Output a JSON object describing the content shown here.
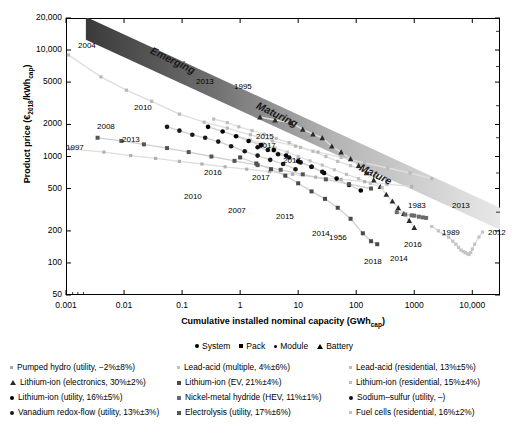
{
  "chart_data": {
    "type": "scatter",
    "title": "",
    "xlabel": "Cumulative installed nominal capacity (GWh_cap)",
    "xlabel_main": "Cumulative installed nominal capacity (GWh",
    "xlabel_sub": "cap",
    "xlabel_tail": ")",
    "ylabel": "Product price (€2018/kWh_cap)",
    "ylabel_a": "Product price (€",
    "ylabel_sub1": "2018",
    "ylabel_b": "/kWh",
    "ylabel_sub2": "cap",
    "ylabel_c": ")",
    "xscale": "log",
    "yscale": "log",
    "xlim": [
      0.001,
      30000
    ],
    "ylim": [
      50,
      20000
    ],
    "grid": false,
    "xticks": [
      "0.001",
      "0.01",
      "0.1",
      "1",
      "10",
      "100",
      "1000",
      "10,000"
    ],
    "xtick_values": [
      0.001,
      0.01,
      0.1,
      1,
      10,
      100,
      1000,
      10000
    ],
    "yticks": [
      "20,000",
      "10,000",
      "5000",
      "2000",
      "1000",
      "500",
      "200",
      "100",
      "50"
    ],
    "ytick_values": [
      20000,
      10000,
      5000,
      2000,
      1000,
      500,
      200,
      100,
      50
    ],
    "legend_position": "below-plot",
    "bands": [
      {
        "label": "Emerging",
        "shade": "dark"
      },
      {
        "label": "Maturing",
        "shade": "medium"
      },
      {
        "label": "Mature",
        "shade": "light"
      }
    ],
    "marker_legend": [
      {
        "label": "System",
        "marker": "circle"
      },
      {
        "label": "Pack",
        "marker": "square"
      },
      {
        "label": "Module",
        "marker": "dot"
      },
      {
        "label": "Battery",
        "marker": "triangle"
      }
    ],
    "series": [
      {
        "name": "Pumped hydro (utility, −2%±8%)",
        "marker": "dot",
        "color": "#b0b0b0",
        "x": [
          0.0012,
          0.0045,
          0.013,
          0.035,
          0.09,
          0.22,
          0.55,
          1.3,
          3.2,
          8.0,
          20,
          55,
          140,
          340,
          900
        ],
        "y": [
          1180,
          1100,
          1020,
          960,
          900,
          850,
          800,
          760,
          720,
          680,
          640,
          610,
          580,
          550,
          520
        ]
      },
      {
        "name": "Lead-acid (multiple, 4%±6%)",
        "marker": "dot",
        "color": "#b8b8b8",
        "x": [
          0.0011,
          0.004,
          0.011,
          0.03,
          0.09,
          0.24,
          0.6,
          1.5,
          3.6,
          9,
          22,
          55,
          140,
          350,
          850,
          2000
        ],
        "y": [
          9000,
          5600,
          4200,
          3300,
          2500,
          2100,
          1850,
          1600,
          1400,
          1250,
          1100,
          980,
          870,
          780,
          700,
          620
        ]
      },
      {
        "name": "Lead-acid (residential, 13%±5%)",
        "marker": "dot",
        "color": "#bdbdbd",
        "x": [
          0.35,
          0.6,
          0.95,
          1.6,
          2.6,
          4.2,
          7,
          11,
          18,
          30,
          48,
          80,
          130,
          210,
          340
        ],
        "y": [
          2250,
          2080,
          1900,
          1750,
          1620,
          1480,
          1350,
          1220,
          1120,
          1000,
          900,
          820,
          740,
          660,
          590
        ]
      },
      {
        "name": "Lithium-ion (electronics, 30%±2%)",
        "marker": "triangle",
        "color": "#2a2a2a",
        "x": [
          2.2,
          4.0,
          7.5,
          12,
          18,
          26,
          38,
          55,
          80,
          110,
          150,
          200,
          260,
          330,
          420,
          530,
          660,
          820,
          1000
        ],
        "y": [
          2350,
          2200,
          2080,
          1800,
          1620,
          1500,
          1250,
          1100,
          950,
          820,
          700,
          600,
          520,
          440,
          380,
          330,
          290,
          250,
          215
        ]
      },
      {
        "name": "Lithium-ion (EV, 21%±4%)",
        "marker": "square",
        "color": "#4a4a4a",
        "x": [
          1.0,
          1.9,
          3.4,
          6,
          10,
          17,
          29,
          48,
          80,
          130,
          180,
          230
        ],
        "y": [
          980,
          860,
          760,
          660,
          560,
          470,
          400,
          330,
          260,
          190,
          160,
          150
        ]
      },
      {
        "name": "Lithium-ion (residential, 15%±4%)",
        "marker": "dot",
        "color": "#c0c0c0",
        "x": [
          0.9,
          1.5,
          2.5,
          4,
          6.5,
          10,
          16,
          26,
          42,
          68,
          110,
          175,
          280
        ],
        "y": [
          1550,
          1430,
          1320,
          1200,
          1100,
          1000,
          910,
          830,
          750,
          680,
          620,
          560,
          510
        ]
      },
      {
        "name": "Lithium-ion (utility, 16%±5%)",
        "marker": "circle",
        "color": "#000000",
        "x": [
          0.28,
          0.5,
          0.85,
          1.4,
          2.3,
          3.8,
          6.2,
          10,
          17,
          28,
          46,
          75,
          120
        ],
        "y": [
          1900,
          1720,
          1550,
          1400,
          1280,
          1150,
          1020,
          900,
          800,
          700,
          620,
          540,
          480
        ]
      },
      {
        "name": "Nickel-metal hydride (HEV, 11%±1%)",
        "marker": "square",
        "color": "#6a6a6a",
        "x": [
          500,
          700,
          900,
          1000,
          1200,
          1400,
          1600
        ],
        "y": [
          300,
          285,
          280,
          278,
          272,
          268,
          265
        ]
      },
      {
        "name": "Sodium–sulfur (utility, –)",
        "marker": "circle",
        "color": "#111111",
        "x": [
          2.0,
          3.0,
          4.5,
          7.0,
          11,
          17,
          26
        ],
        "y": [
          1220,
          1150,
          1050,
          980,
          880,
          800,
          720
        ]
      },
      {
        "name": "Vanadium redox-flow (utility, 13%±3%)",
        "marker": "circle",
        "color": "#1a1a1a",
        "x": [
          0.055,
          0.09,
          0.15,
          0.25,
          0.42,
          0.7,
          1.2,
          2.0,
          3.3,
          5.5,
          9.0
        ],
        "y": [
          1900,
          1750,
          1600,
          1500,
          1380,
          1250,
          1120,
          1020,
          930,
          850,
          760
        ]
      },
      {
        "name": "Electrolysis (utility, 17%±6%)",
        "marker": "square",
        "color": "#555555",
        "x": [
          0.0035,
          0.009,
          0.022,
          0.055,
          0.13,
          0.32,
          0.8,
          2.0,
          5,
          12,
          30,
          75,
          180
        ],
        "y": [
          1500,
          1400,
          1300,
          1200,
          1100,
          1000,
          910,
          830,
          750,
          680,
          610,
          550,
          500
        ]
      },
      {
        "name": "Fuel cells (residential, 16%±2%)",
        "marker": "dot",
        "color": "#c4c4c4",
        "x": [
          2000,
          2600,
          3200,
          3900,
          4600,
          5200,
          5800,
          6400,
          7000,
          7600,
          8200,
          8800,
          9400,
          10000,
          11000,
          13000,
          15000
        ],
        "y": [
          220,
          200,
          185,
          175,
          160,
          150,
          140,
          132,
          128,
          125,
          122,
          120,
          125,
          135,
          150,
          175,
          195
        ]
      }
    ],
    "annotations": [
      {
        "text": "2004",
        "x": 78,
        "y": 41
      },
      {
        "text": "1997",
        "x": 66,
        "y": 143
      },
      {
        "text": "2008",
        "x": 97,
        "y": 122
      },
      {
        "text": "2013",
        "x": 122,
        "y": 135
      },
      {
        "text": "2010",
        "x": 134,
        "y": 103
      },
      {
        "text": "2013",
        "x": 196,
        "y": 77
      },
      {
        "text": "1995",
        "x": 234,
        "y": 82
      },
      {
        "text": "2015",
        "x": 256,
        "y": 132
      },
      {
        "text": "2017",
        "x": 258,
        "y": 141
      },
      {
        "text": "2017",
        "x": 283,
        "y": 156
      },
      {
        "text": "2017",
        "x": 252,
        "y": 173
      },
      {
        "text": "2016",
        "x": 204,
        "y": 168
      },
      {
        "text": "2010",
        "x": 184,
        "y": 192
      },
      {
        "text": "2007",
        "x": 228,
        "y": 206
      },
      {
        "text": "2015",
        "x": 276,
        "y": 212
      },
      {
        "text": "2014",
        "x": 312,
        "y": 229
      },
      {
        "text": "1956",
        "x": 329,
        "y": 233
      },
      {
        "text": "2018",
        "x": 364,
        "y": 257
      },
      {
        "text": "2014",
        "x": 390,
        "y": 254
      },
      {
        "text": "2016",
        "x": 404,
        "y": 240
      },
      {
        "text": "1983",
        "x": 408,
        "y": 201
      },
      {
        "text": "2013",
        "x": 452,
        "y": 201
      },
      {
        "text": "1989",
        "x": 442,
        "y": 228
      },
      {
        "text": "2012",
        "x": 488,
        "y": 228
      }
    ]
  },
  "legend_columns": [
    [
      {
        "label": "Pumped hydro (utility, −2%±8%)",
        "marker": "dot",
        "color": "#a8a8a8"
      },
      {
        "label": "Lithium-ion (electronics, 30%±2%)",
        "marker": "triangle",
        "color": "#2a2a2a"
      },
      {
        "label": "Lithium-ion (utility, 16%±5%)",
        "marker": "circle",
        "color": "#000000"
      },
      {
        "label": "Vanadium redox-flow (utility, 13%±3%)",
        "marker": "circle",
        "color": "#1a1a1a"
      }
    ],
    [
      {
        "label": "Lead-acid (multiple, 4%±6%)",
        "marker": "dot",
        "color": "#c0c0c0"
      },
      {
        "label": "Lithium-ion (EV, 21%±4%)",
        "marker": "square",
        "color": "#4a4a4a"
      },
      {
        "label": "Nickel-metal hydride (HEV, 11%±1%)",
        "marker": "square",
        "color": "#6a6a6a"
      },
      {
        "label": "Electrolysis (utility, 17%±6%)",
        "marker": "square",
        "color": "#555555"
      }
    ],
    [
      {
        "label": "Lead-acid (residential, 13%±5%)",
        "marker": "dot",
        "color": "#bdbdbd"
      },
      {
        "label": "Lithium-ion (residential, 15%±4%)",
        "marker": "dot",
        "color": "#c0c0c0"
      },
      {
        "label": "Sodium–sulfur (utility, –)",
        "marker": "circle",
        "color": "#111111"
      },
      {
        "label": "Fuel cells (residential, 16%±2%)",
        "marker": "dot",
        "color": "#c4c4c4"
      }
    ]
  ]
}
